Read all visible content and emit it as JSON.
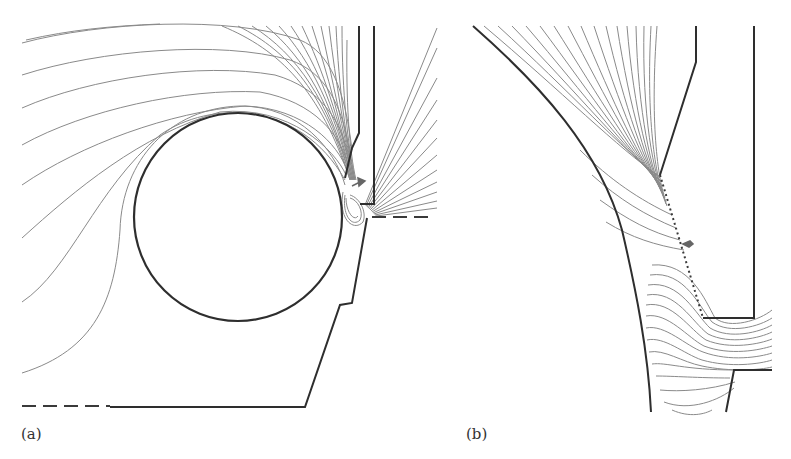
{
  "figure": {
    "panels": [
      {
        "id": "a",
        "label": "(a)",
        "description": "Equipotential field lines around circular electrode inside stepped boundary with narrow gap",
        "circle": {
          "cx": 238,
          "cy": 217,
          "r": 104
        },
        "field_line_count_left": 9,
        "field_line_count_fan": 20,
        "field_line_count_right_fan": 12
      },
      {
        "id": "b",
        "label": "(b)",
        "description": "Enlarged view of gap region showing field-line fan and dotted boundary segment",
        "field_line_count_upper": 18,
        "field_line_count_lower": 14
      }
    ],
    "colors": {
      "boundary": "#2e2e2e",
      "field_lines": "#8a8a8a",
      "background": "#ffffff",
      "label": "#333333"
    }
  }
}
